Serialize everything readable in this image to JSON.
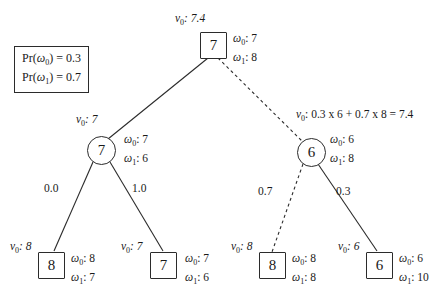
{
  "diagram": {
    "type": "decision-tree",
    "prior_box": {
      "line1_prefix": "Pr(",
      "line1_symbol": "ω",
      "line1_sub": "0",
      "line1_suffix": ") = 0.3",
      "line2_prefix": "Pr(",
      "line2_symbol": "ω",
      "line2_sub": "1",
      "line2_suffix": ") = 0.7",
      "full_line1": "Pr(ω0) = 0.3",
      "full_line2": "Pr(ω1) = 0.7"
    },
    "nodes": {
      "root": {
        "shape": "square",
        "value": "7",
        "v0_label": "v",
        "v0_sub": "0",
        "v0_text": ": 7.4",
        "omega0": ": 7",
        "omega1": ": 8"
      },
      "left_internal": {
        "shape": "circle",
        "value": "7",
        "v0_label": "v",
        "v0_sub": "0",
        "v0_text": ": 7",
        "omega0": ": 7",
        "omega1": ": 6"
      },
      "right_internal": {
        "shape": "circle",
        "value": "6",
        "omega0": ": 6",
        "omega1": ": 8"
      },
      "leaf1": {
        "shape": "square",
        "value": "8",
        "v0_label": "v",
        "v0_sub": "0",
        "v0_text": ": 8",
        "omega0": ": 8",
        "omega1": ": 7"
      },
      "leaf2": {
        "shape": "square",
        "value": "7",
        "v0_label": "v",
        "v0_sub": "0",
        "v0_text": ": 7",
        "omega0": ": 7",
        "omega1": ": 6"
      },
      "leaf3": {
        "shape": "square",
        "value": "8",
        "v0_label": "v",
        "v0_sub": "0",
        "v0_text": ": 8",
        "omega0": ": 8",
        "omega1": ": 8"
      },
      "leaf4": {
        "shape": "square",
        "value": "6",
        "v0_label": "v",
        "v0_sub": "0",
        "v0_text": ": 6",
        "omega0": ": 6",
        "omega1": ": 10"
      }
    },
    "edges": {
      "root_left": {
        "style": "solid",
        "label": ""
      },
      "root_right": {
        "style": "dashed",
        "label": ""
      },
      "left_leaf1": {
        "style": "solid",
        "label": "0.0"
      },
      "left_leaf2": {
        "style": "solid",
        "label": "1.0"
      },
      "right_leaf3": {
        "style": "dashed",
        "label": "0.7"
      },
      "right_leaf4": {
        "style": "solid",
        "label": "0.3"
      }
    },
    "calculation": {
      "v_label": "v",
      "v_sub": "0",
      "expression": ": 0.3 x 6 + 0.7 x 8 =  7.4"
    },
    "symbols": {
      "omega": "ω",
      "v": "v"
    },
    "colors": {
      "stroke": "#2b2b2b",
      "background": "#ffffff",
      "text": "#1a1a1a"
    }
  }
}
